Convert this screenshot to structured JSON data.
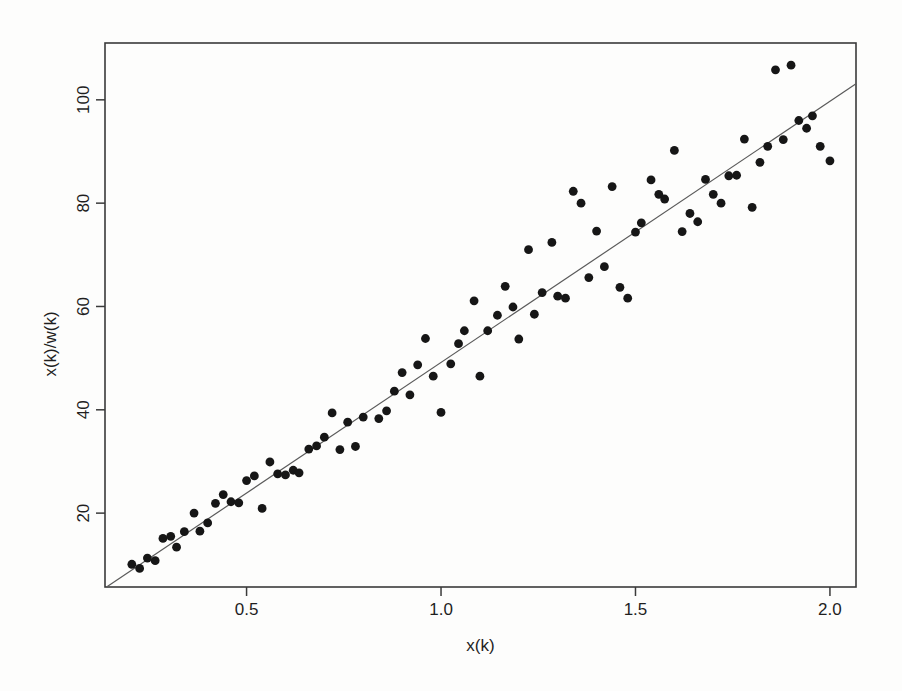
{
  "figure": {
    "background": "#fdfdfc"
  },
  "chart_data": {
    "type": "scatter",
    "title": "",
    "xlabel": "x(k)",
    "ylabel": "x(k)/w(k)",
    "xlim": [
      0.136,
      2.067
    ],
    "ylim": [
      5.7,
      111.0
    ],
    "x_ticks": [
      0.5,
      1.0,
      1.5,
      2.0
    ],
    "x_tick_labels": [
      "0.5",
      "1.0",
      "1.5",
      "2.0"
    ],
    "y_ticks": [
      20,
      40,
      60,
      80,
      100
    ],
    "y_tick_labels": [
      "20",
      "40",
      "60",
      "80",
      "100"
    ],
    "grid": false,
    "legend": null,
    "point_color": "#161616",
    "point_radius": 4.4,
    "box_color": "#3a3a3a",
    "text_color": "#1f1f1f",
    "fit_line": {
      "type": "regression-line",
      "slope": 50.6,
      "intercept": -1.5,
      "x_start": 0.14,
      "x_end": 2.067,
      "color": "#5a5a5a"
    },
    "points": [
      [
        0.205,
        10.1
      ],
      [
        0.225,
        9.3
      ],
      [
        0.245,
        11.3
      ],
      [
        0.265,
        10.8
      ],
      [
        0.285,
        15.1
      ],
      [
        0.305,
        15.5
      ],
      [
        0.32,
        13.4
      ],
      [
        0.34,
        16.4
      ],
      [
        0.365,
        20.0
      ],
      [
        0.38,
        16.5
      ],
      [
        0.4,
        18.1
      ],
      [
        0.42,
        21.9
      ],
      [
        0.44,
        23.6
      ],
      [
        0.46,
        22.2
      ],
      [
        0.48,
        22.0
      ],
      [
        0.5,
        26.3
      ],
      [
        0.52,
        27.2
      ],
      [
        0.54,
        20.9
      ],
      [
        0.56,
        29.9
      ],
      [
        0.58,
        27.6
      ],
      [
        0.6,
        27.4
      ],
      [
        0.62,
        28.3
      ],
      [
        0.635,
        27.8
      ],
      [
        0.66,
        32.4
      ],
      [
        0.68,
        33.0
      ],
      [
        0.7,
        34.7
      ],
      [
        0.72,
        39.4
      ],
      [
        0.74,
        32.3
      ],
      [
        0.76,
        37.6
      ],
      [
        0.78,
        32.9
      ],
      [
        0.8,
        38.6
      ],
      [
        0.84,
        38.3
      ],
      [
        0.86,
        39.8
      ],
      [
        0.88,
        43.6
      ],
      [
        0.9,
        47.2
      ],
      [
        0.92,
        42.9
      ],
      [
        0.94,
        48.7
      ],
      [
        0.96,
        53.8
      ],
      [
        0.98,
        46.5
      ],
      [
        1.0,
        39.5
      ],
      [
        1.025,
        48.9
      ],
      [
        1.045,
        52.8
      ],
      [
        1.06,
        55.3
      ],
      [
        1.085,
        61.1
      ],
      [
        1.1,
        46.5
      ],
      [
        1.12,
        55.3
      ],
      [
        1.145,
        58.3
      ],
      [
        1.165,
        63.9
      ],
      [
        1.185,
        59.9
      ],
      [
        1.2,
        53.7
      ],
      [
        1.225,
        71.0
      ],
      [
        1.24,
        58.5
      ],
      [
        1.26,
        62.7
      ],
      [
        1.285,
        72.4
      ],
      [
        1.3,
        62.0
      ],
      [
        1.32,
        61.6
      ],
      [
        1.34,
        82.3
      ],
      [
        1.36,
        80.0
      ],
      [
        1.38,
        65.6
      ],
      [
        1.4,
        74.6
      ],
      [
        1.42,
        67.7
      ],
      [
        1.44,
        83.2
      ],
      [
        1.46,
        63.7
      ],
      [
        1.48,
        61.6
      ],
      [
        1.5,
        74.4
      ],
      [
        1.515,
        76.2
      ],
      [
        1.54,
        84.5
      ],
      [
        1.56,
        81.7
      ],
      [
        1.575,
        80.8
      ],
      [
        1.6,
        90.2
      ],
      [
        1.62,
        74.5
      ],
      [
        1.64,
        78.0
      ],
      [
        1.66,
        76.4
      ],
      [
        1.68,
        84.6
      ],
      [
        1.7,
        81.7
      ],
      [
        1.72,
        80.0
      ],
      [
        1.74,
        85.3
      ],
      [
        1.76,
        85.4
      ],
      [
        1.78,
        92.4
      ],
      [
        1.8,
        79.2
      ],
      [
        1.82,
        87.9
      ],
      [
        1.84,
        91.0
      ],
      [
        1.86,
        105.8
      ],
      [
        1.88,
        92.3
      ],
      [
        1.9,
        106.7
      ],
      [
        1.92,
        96.0
      ],
      [
        1.94,
        94.5
      ],
      [
        1.955,
        96.9
      ],
      [
        1.975,
        91.0
      ],
      [
        2.0,
        88.2
      ]
    ]
  }
}
